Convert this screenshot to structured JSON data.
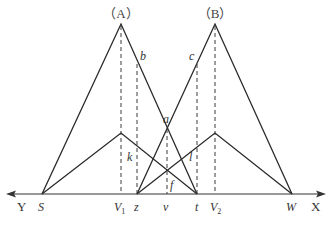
{
  "diagram": {
    "panels": [
      {
        "id": "A",
        "label": "（A）"
      },
      {
        "id": "B",
        "label": "（B）"
      }
    ],
    "axis": {
      "left_label": "Y",
      "right_label": "X"
    },
    "axis_points": {
      "S": "S",
      "V1": "V",
      "V1_sub": "1",
      "z": "z",
      "v": "v",
      "t": "t",
      "V2": "V",
      "V2_sub": "2",
      "W": "W"
    },
    "curve_labels": {
      "a": "a",
      "b": "b",
      "c": "c",
      "k": "k",
      "l": "l",
      "f": "f"
    }
  }
}
